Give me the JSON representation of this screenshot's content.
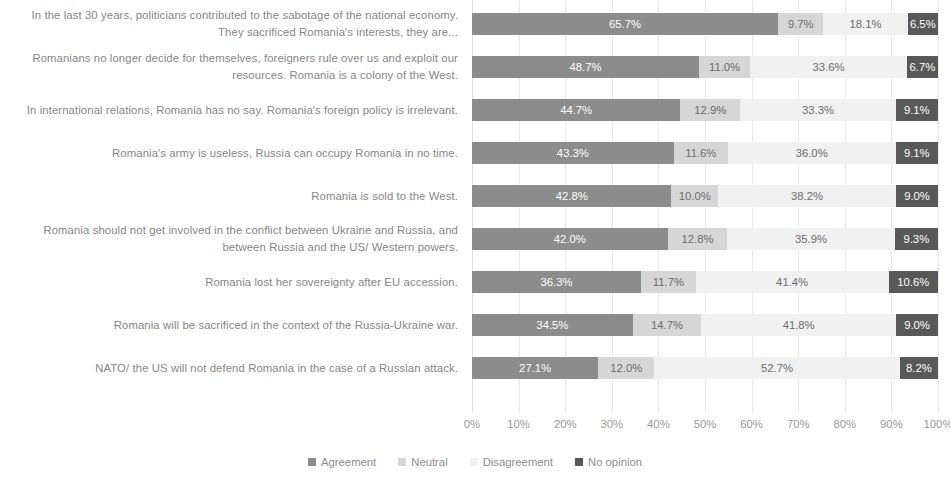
{
  "chart_data": {
    "type": "bar",
    "subtype": "horizontal-stacked-100-percent",
    "title": "",
    "subtitle": "",
    "xlabel": "",
    "ylabel": "",
    "xlim": [
      0,
      100
    ],
    "xticks": [
      "0%",
      "10%",
      "20%",
      "30%",
      "40%",
      "50%",
      "60%",
      "70%",
      "80%",
      "90%",
      "100%"
    ],
    "grid": true,
    "grid_axis": "x",
    "legend_position": "bottom-center",
    "value_suffix": "%",
    "categories": [
      "In the last 30 years, politicians contributed to the sabotage of the national economy. They sacrificed Romania's interests, they are...",
      "Romanians no longer decide for themselves, foreigners rule over us and exploit our resources.  Romania is a colony of the West.",
      "In international relations, Romania has no say. Romania's foreign policy is irrelevant.",
      "Romania's army is useless, Russia can occupy Romania in no time.",
      "Romania is sold to the West.",
      "Romania should not get involved in the conflict between Ukraine and Russia, and between Russia and  the US/ Western powers.",
      "Romania lost her sovereignty after EU accession.",
      "Romania will be sacrificed in the context of the Russia-Ukraine war.",
      "NATO/ the US will not defend Romania in the case of a Russian attack."
    ],
    "series": [
      {
        "name": "Agreement",
        "color": "#8c8c8c",
        "values": [
          65.7,
          48.7,
          44.7,
          43.3,
          42.8,
          42.0,
          36.3,
          34.5,
          27.1
        ],
        "labels": [
          "65.7%",
          "48.7%",
          "44.7%",
          "43.3%",
          "42.8%",
          "42.0%",
          "36.3%",
          "34.5%",
          "27.1%"
        ]
      },
      {
        "name": "Neutral",
        "color": "#d6d6d6",
        "values": [
          9.7,
          11.0,
          12.9,
          11.6,
          10.0,
          12.8,
          11.7,
          14.7,
          12.0
        ],
        "labels": [
          "9.7%",
          "11.0%",
          "12.9%",
          "11.6%",
          "10.0%",
          "12.8%",
          "11.7%",
          "14.7%",
          "12.0%"
        ]
      },
      {
        "name": "Disagreement",
        "color": "#f1f1f1",
        "values": [
          18.1,
          33.6,
          33.3,
          36.0,
          38.2,
          35.9,
          41.4,
          41.8,
          52.7
        ],
        "labels": [
          "18.1%",
          "33.6%",
          "33.3%",
          "36.0%",
          "38.2%",
          "35.9%",
          "41.4%",
          "41.8%",
          "52.7%"
        ]
      },
      {
        "name": "No opinion",
        "color": "#585858",
        "values": [
          6.5,
          6.7,
          9.1,
          9.1,
          9.0,
          9.3,
          10.6,
          9.0,
          8.2
        ],
        "labels": [
          "6.5%",
          "6.7%",
          "9.1%",
          "9.1%",
          "9.0%",
          "9.3%",
          "10.6%",
          "9.0%",
          "8.2%"
        ]
      }
    ]
  },
  "legend": {
    "items": [
      {
        "label": "Agreement",
        "color": "#8c8c8c"
      },
      {
        "label": "Neutral",
        "color": "#d6d6d6"
      },
      {
        "label": "Disagreement",
        "color": "#f1f1f1"
      },
      {
        "label": "No opinion",
        "color": "#585858"
      }
    ]
  }
}
